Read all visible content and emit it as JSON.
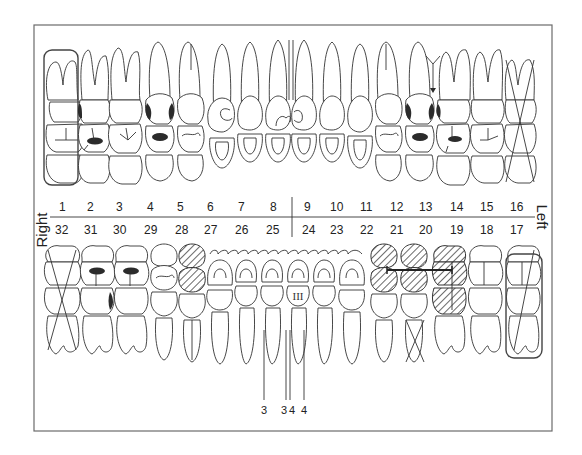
{
  "diagram": {
    "type": "dental-chart",
    "side_labels": {
      "right": "Right",
      "left": "Left"
    },
    "upper_numbers": [
      "1",
      "2",
      "3",
      "4",
      "5",
      "6",
      "7",
      "8",
      "9",
      "10",
      "11",
      "12",
      "13",
      "14",
      "15",
      "16"
    ],
    "lower_numbers": [
      "32",
      "31",
      "30",
      "29",
      "28",
      "27",
      "26",
      "25",
      "24",
      "23",
      "22",
      "21",
      "20",
      "19",
      "18",
      "17"
    ],
    "pocket_labels": [
      "3",
      "3",
      "4",
      "4"
    ],
    "roman_mark": "III",
    "annotations": {
      "missing_boxed": [
        "1",
        "17"
      ],
      "extracted_x": [
        "16",
        "32",
        "20"
      ],
      "hatched_crowns": [
        "28",
        "21",
        "20",
        "19"
      ],
      "bridge_span": [
        "21",
        "19"
      ],
      "caries_dark": [
        "2",
        "4",
        "13",
        "14",
        "30",
        "31"
      ],
      "gingival_line_teeth": [
        "27",
        "26",
        "25",
        "24",
        "23",
        "22"
      ],
      "midline_gap_arrow": "13-14"
    },
    "colors": {
      "line": "#333333",
      "frame": "#6b6b6b",
      "fill_dark": "#2b2b2b"
    }
  }
}
